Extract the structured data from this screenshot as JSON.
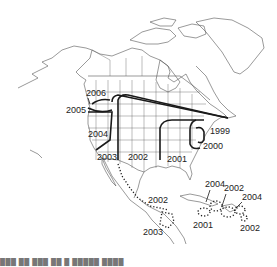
{
  "map": {
    "title": "",
    "region": "North America, Central America and Caribbean",
    "line_color": "#1a1a1a",
    "border_color": "#555555",
    "labels": [
      {
        "id": "l1999",
        "text": "1999",
        "x": 210,
        "y": 131
      },
      {
        "id": "l2000",
        "text": "2000",
        "x": 203,
        "y": 146
      },
      {
        "id": "l2001-us",
        "text": "2001",
        "x": 167,
        "y": 159
      },
      {
        "id": "l2002-us",
        "text": "2002",
        "x": 128,
        "y": 157
      },
      {
        "id": "l2003-us",
        "text": "2003",
        "x": 97,
        "y": 157
      },
      {
        "id": "l2004-us",
        "text": "2004",
        "x": 88,
        "y": 134
      },
      {
        "id": "l2005",
        "text": "2005",
        "x": 67,
        "y": 110
      },
      {
        "id": "l2006",
        "text": "2006",
        "x": 86,
        "y": 93
      },
      {
        "id": "l2002-mx",
        "text": "2002",
        "x": 148,
        "y": 200
      },
      {
        "id": "l2003-ca",
        "text": "2003",
        "x": 143,
        "y": 227
      },
      {
        "id": "l2004-cu",
        "text": "2004",
        "x": 206,
        "y": 184
      },
      {
        "id": "l2002-pr",
        "text": "2002",
        "x": 224,
        "y": 187
      },
      {
        "id": "l2004-la",
        "text": "2004",
        "x": 242,
        "y": 196
      },
      {
        "id": "l2001-ja",
        "text": "2001",
        "x": 193,
        "y": 223
      },
      {
        "id": "l2002-ea",
        "text": "2002",
        "x": 240,
        "y": 226
      }
    ]
  },
  "caption": "███ ██ ███ ██ █ █████ ████"
}
